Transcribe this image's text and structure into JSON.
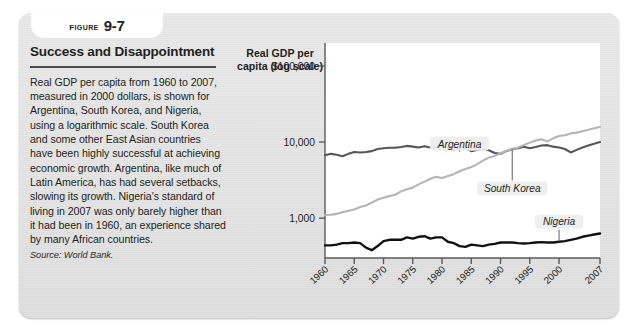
{
  "figure": {
    "label_word": "FIGURE",
    "number": "9-7",
    "title": "Success and Disappointment",
    "body": "Real GDP per capita from 1960 to 2007, measured in 2000 dollars, is shown for Argentina, South Korea, and Nigeria, using a logarithmic scale. South Korea and some other East Asian countries have been highly successful at achieving economic growth. Argentina, like much of Latin America, has had several setbacks, slowing its growth. Nigeria's standard of living in 2007 was only barely higher than it had been in 1960, an experience shared by many African countries.",
    "source": "Source: World Bank."
  },
  "colors": {
    "panel": "#e3e3e3",
    "plot_background": "#ffffff",
    "axis": "#5a5a5a",
    "argentina": "#565656",
    "south_korea": "#b4b4b4",
    "nigeria": "#111111",
    "text": "#231f20"
  },
  "chart_data": {
    "type": "line",
    "title": "Success and Disappointment",
    "subtitle": "",
    "xlabel": "Year",
    "ylabel": "Real GDP per capita (log scale)",
    "ylabel_lines": [
      "Real GDP per",
      "capita (log scale)"
    ],
    "yscale": "log",
    "ylim": [
      300,
      200000
    ],
    "ytick_labels": [
      "$100,000",
      "10,000",
      "1,000"
    ],
    "ytick_values": [
      100000,
      10000,
      1000
    ],
    "grid": false,
    "legend_position": "inline-annotations",
    "xlim": [
      1960,
      2007
    ],
    "xtick_labels": [
      "1960",
      "1965",
      "1970",
      "1975",
      "1980",
      "1985",
      "1990",
      "1995",
      "2000",
      "2007"
    ],
    "xtick_values": [
      1960,
      1965,
      1970,
      1975,
      1980,
      1985,
      1990,
      1995,
      2000,
      2007
    ],
    "annotations": [
      {
        "text": "Argentina",
        "series": "Argentina",
        "x": 1983,
        "y": 9500
      },
      {
        "text": "South Korea",
        "series": "South Korea",
        "x": 1992,
        "y": 2450
      },
      {
        "text": "Nigeria",
        "series": "Nigeria",
        "x": 2000,
        "y": 900
      }
    ],
    "series": [
      {
        "name": "Argentina",
        "color": "#565656",
        "x": [
          1960,
          1961,
          1962,
          1963,
          1964,
          1965,
          1966,
          1967,
          1968,
          1969,
          1970,
          1971,
          1972,
          1973,
          1974,
          1975,
          1976,
          1977,
          1978,
          1979,
          1980,
          1981,
          1982,
          1983,
          1984,
          1985,
          1986,
          1987,
          1988,
          1989,
          1990,
          1991,
          1992,
          1993,
          1994,
          1995,
          1996,
          1997,
          1998,
          1999,
          2000,
          2001,
          2002,
          2003,
          2004,
          2005,
          2006,
          2007
        ],
        "values": [
          6700,
          7000,
          6800,
          6500,
          7000,
          7400,
          7300,
          7400,
          7600,
          8100,
          8300,
          8400,
          8400,
          8600,
          8900,
          8700,
          8500,
          8800,
          8500,
          8900,
          8800,
          8200,
          8000,
          8200,
          8300,
          7600,
          7900,
          8100,
          7800,
          7200,
          7000,
          7600,
          8100,
          8300,
          8700,
          8300,
          8600,
          9000,
          9100,
          8700,
          8500,
          8100,
          7300,
          7900,
          8500,
          9000,
          9500,
          10000
        ]
      },
      {
        "name": "South Korea",
        "color": "#b4b4b4",
        "x": [
          1960,
          1961,
          1962,
          1963,
          1964,
          1965,
          1966,
          1967,
          1968,
          1969,
          1970,
          1971,
          1972,
          1973,
          1974,
          1975,
          1976,
          1977,
          1978,
          1979,
          1980,
          1981,
          1982,
          1983,
          1984,
          1985,
          1986,
          1987,
          1988,
          1989,
          1990,
          1991,
          1992,
          1993,
          1994,
          1995,
          1996,
          1997,
          1998,
          1999,
          2000,
          2001,
          2002,
          2003,
          2004,
          2005,
          2006,
          2007
        ],
        "values": [
          1100,
          1110,
          1140,
          1200,
          1250,
          1300,
          1400,
          1470,
          1600,
          1760,
          1860,
          1960,
          2030,
          2250,
          2400,
          2520,
          2780,
          3020,
          3290,
          3490,
          3380,
          3570,
          3790,
          4130,
          4420,
          4690,
          5140,
          5700,
          6250,
          6580,
          7130,
          7700,
          8080,
          8500,
          9140,
          9830,
          10450,
          10900,
          10200,
          11200,
          12000,
          12300,
          13000,
          13300,
          13900,
          14500,
          15200,
          15800
        ]
      },
      {
        "name": "Nigeria",
        "color": "#111111",
        "x": [
          1960,
          1961,
          1962,
          1963,
          1964,
          1965,
          1966,
          1967,
          1968,
          1969,
          1970,
          1971,
          1972,
          1973,
          1974,
          1975,
          1976,
          1977,
          1978,
          1979,
          1980,
          1981,
          1982,
          1983,
          1984,
          1985,
          1986,
          1987,
          1988,
          1989,
          1990,
          1991,
          1992,
          1993,
          1994,
          1995,
          1996,
          1997,
          1998,
          1999,
          2000,
          2001,
          2002,
          2003,
          2004,
          2005,
          2006,
          2007
        ],
        "values": [
          440,
          440,
          450,
          470,
          470,
          480,
          470,
          410,
          380,
          430,
          500,
          520,
          520,
          520,
          560,
          540,
          570,
          580,
          540,
          560,
          560,
          490,
          470,
          430,
          420,
          450,
          440,
          430,
          450,
          460,
          480,
          480,
          480,
          470,
          465,
          470,
          480,
          485,
          480,
          480,
          490,
          500,
          520,
          540,
          570,
          590,
          610,
          630
        ]
      }
    ]
  }
}
